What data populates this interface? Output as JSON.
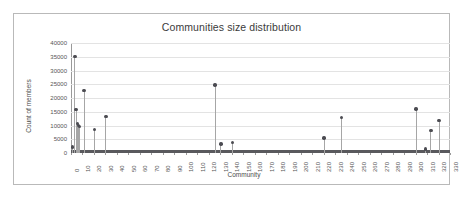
{
  "chart_data": {
    "type": "scatter",
    "title": "Communities size distribution",
    "xlabel": "Community",
    "ylabel": "Count of members",
    "xlim": [
      0,
      330
    ],
    "ylim": [
      0,
      40000
    ],
    "grid": true,
    "legend": "none",
    "y_ticks": [
      0,
      5000,
      10000,
      15000,
      20000,
      25000,
      30000,
      35000,
      40000
    ],
    "y_tick_labels": [
      "0",
      "5000",
      "10000",
      "15000",
      "20000",
      "25000",
      "30000",
      "35000",
      "40000"
    ],
    "x_ticks": [
      0,
      10,
      20,
      30,
      40,
      50,
      60,
      70,
      80,
      90,
      100,
      110,
      120,
      130,
      140,
      150,
      160,
      170,
      180,
      190,
      200,
      210,
      220,
      230,
      240,
      250,
      260,
      270,
      280,
      290,
      300,
      310,
      320,
      330
    ],
    "x_tick_labels": [
      "0",
      "10",
      "20",
      "30",
      "40",
      "50",
      "60",
      "70",
      "80",
      "90",
      "100",
      "110",
      "120",
      "130",
      "140",
      "150",
      "160",
      "170",
      "180",
      "190",
      "200",
      "210",
      "220",
      "230",
      "240",
      "250",
      "260",
      "270",
      "280",
      "290",
      "300",
      "310",
      "320",
      "330"
    ],
    "marker_color": "#4c4c52",
    "stem_color": "#a6a6a6",
    "grid_color": "#e3e3e3",
    "x": [
      1,
      3,
      4,
      5,
      6,
      7,
      11,
      20,
      30,
      125,
      130,
      140,
      220,
      235,
      300,
      308,
      313,
      320
    ],
    "values": [
      2200,
      35000,
      15800,
      10800,
      10100,
      9600,
      22700,
      8600,
      13300,
      24700,
      3300,
      3800,
      5500,
      12900,
      16000,
      1500,
      8200,
      11800
    ],
    "points": [
      {
        "x": 1,
        "y": 2200
      },
      {
        "x": 3,
        "y": 35000
      },
      {
        "x": 4,
        "y": 15800
      },
      {
        "x": 5,
        "y": 10800
      },
      {
        "x": 6,
        "y": 10100
      },
      {
        "x": 7,
        "y": 9600
      },
      {
        "x": 11,
        "y": 22700
      },
      {
        "x": 20,
        "y": 8600
      },
      {
        "x": 30,
        "y": 13300
      },
      {
        "x": 125,
        "y": 24700
      },
      {
        "x": 130,
        "y": 3300
      },
      {
        "x": 140,
        "y": 3800
      },
      {
        "x": 220,
        "y": 5500
      },
      {
        "x": 235,
        "y": 12900
      },
      {
        "x": 300,
        "y": 16000
      },
      {
        "x": 308,
        "y": 1500
      },
      {
        "x": 313,
        "y": 8200
      },
      {
        "x": 320,
        "y": 11800
      }
    ],
    "baseline_note": "All other community indices from 0 to 330 have near-zero member counts, forming a dense dark band along the x-axis."
  }
}
